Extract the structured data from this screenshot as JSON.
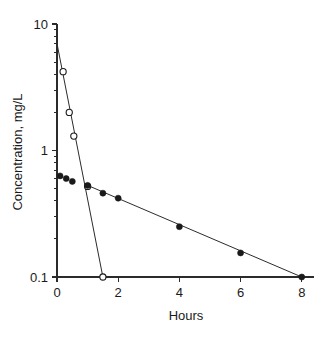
{
  "chart_data": {
    "type": "line",
    "title": "",
    "xlabel": "Hours",
    "ylabel": "Concentration, mg/L",
    "xscale": "linear",
    "yscale": "log",
    "xlim": [
      0,
      8.4
    ],
    "ylim": [
      0.1,
      10
    ],
    "grid": false,
    "legend": "none",
    "xticks": [
      "0",
      "2",
      "4",
      "6",
      "8"
    ],
    "xtick_values": [
      0,
      2,
      4,
      6,
      8
    ],
    "yticks": [
      "10",
      "1",
      "0.1"
    ],
    "ytick_values": [
      10,
      1,
      0.1
    ],
    "series": [
      {
        "name": "distribution-phase",
        "marker": "open-circle",
        "x": [
          0.2,
          0.4,
          0.55,
          1.0,
          1.5
        ],
        "values": [
          4.2,
          2.0,
          1.3,
          0.52,
          0.1
        ],
        "fit_line": {
          "x": [
            0.0,
            1.5
          ],
          "values": [
            7.0,
            0.1
          ]
        }
      },
      {
        "name": "elimination-phase",
        "marker": "filled-circle",
        "x": [
          0.1,
          0.3,
          0.5,
          1.0,
          1.5,
          2.0,
          4.0,
          6.0,
          8.0
        ],
        "values": [
          0.63,
          0.6,
          0.57,
          0.53,
          0.46,
          0.42,
          0.25,
          0.155,
          0.1
        ],
        "fit_line": {
          "x": [
            1.0,
            8.0
          ],
          "values": [
            0.53,
            0.1
          ]
        }
      }
    ]
  },
  "colors": {
    "axis": "#2b2b2b",
    "marker_filled": "#1a1a1a",
    "marker_open_fill": "#ffffff",
    "background": "#ffffff"
  }
}
